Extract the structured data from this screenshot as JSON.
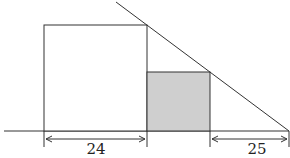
{
  "diagram": {
    "type": "geometry",
    "colors": {
      "stroke": "#333333",
      "shaded_fill": "#cfcfcf",
      "background": "#ffffff"
    },
    "labels": {
      "left_width": "24",
      "right_gap": "25"
    },
    "shapes": {
      "large_square": {
        "x": 44,
        "y": 25,
        "w": 103,
        "h": 106
      },
      "shaded_rect": {
        "x": 147,
        "y": 72,
        "w": 63,
        "h": 59
      },
      "baseline": {
        "x1": 4,
        "x2": 289,
        "y": 131
      },
      "diagonal": {
        "x1": 116,
        "y1": 2,
        "x2": 289,
        "y2": 131
      }
    }
  }
}
